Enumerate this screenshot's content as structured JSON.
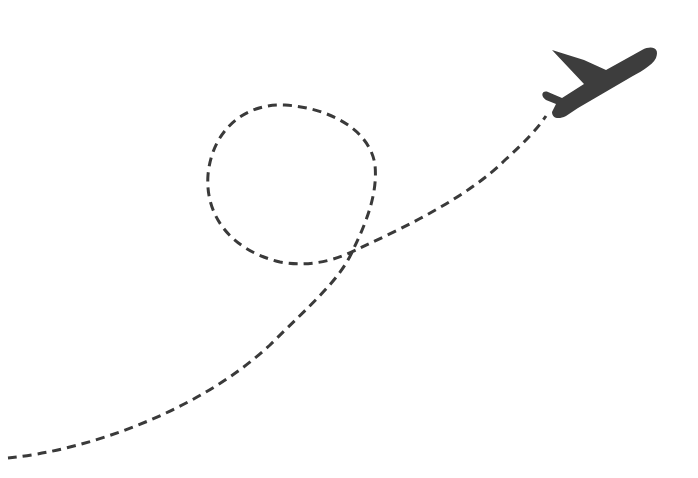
{
  "illustration": {
    "subject": "airplane taking off with dashed looping flight path",
    "icon": "airplane-icon",
    "colors": {
      "background": "#ffffff",
      "stroke": "#3a3a3a",
      "plane": "#3d3d3d"
    },
    "path": {
      "style": "dashed",
      "dash_pattern": "9 6",
      "stroke_width": 3,
      "has_loop": true
    }
  }
}
